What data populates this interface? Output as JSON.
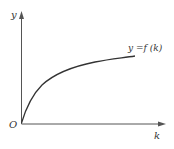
{
  "diagram": {
    "type": "function-curve",
    "axes": {
      "y_label": "y",
      "x_label": "k",
      "origin_label": "O"
    },
    "curve": {
      "label": "y =f (k)",
      "shape": "concave increasing, passing through origin",
      "color": "#333333"
    },
    "colors": {
      "axis": "#555555",
      "text": "#333333",
      "background": "#ffffff"
    }
  }
}
